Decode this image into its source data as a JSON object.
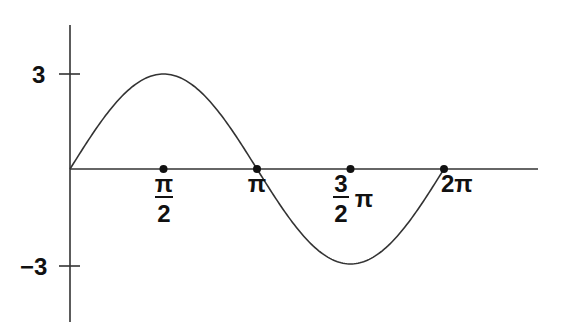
{
  "chart_data": {
    "type": "line",
    "title": "",
    "xlabel": "",
    "ylabel": "",
    "function": "y = 3 sin(x)",
    "amplitude": 3,
    "period": "2π",
    "x_ticks": [
      {
        "value": 1.5708,
        "label": "π/2",
        "num": "π",
        "den": "2"
      },
      {
        "value": 3.1416,
        "label": "π"
      },
      {
        "value": 4.7124,
        "label": "3/2 π",
        "num": "3",
        "den": "2",
        "suffix": "π"
      },
      {
        "value": 6.2832,
        "label": "2π"
      }
    ],
    "y_ticks": [
      {
        "value": 3,
        "label": "3"
      },
      {
        "value": -3,
        "label": "−3"
      }
    ],
    "series": [
      {
        "name": "3 sin x",
        "x": [
          0,
          0.7854,
          1.5708,
          2.3562,
          3.1416,
          3.927,
          4.7124,
          5.4978,
          6.2832
        ],
        "values": [
          0,
          2.12,
          3,
          2.12,
          0,
          -2.12,
          -3,
          -2.12,
          0
        ]
      }
    ],
    "xlim": [
      0,
      8.1
    ],
    "ylim": [
      -4.6,
      4.6
    ],
    "grid": false,
    "legend": false,
    "marked_points": [
      {
        "x": 1.5708,
        "y": 0
      },
      {
        "x": 3.1416,
        "y": 0
      },
      {
        "x": 4.7124,
        "y": 0
      },
      {
        "x": 6.2832,
        "y": 0
      }
    ]
  },
  "labels": {
    "y_pos": "3",
    "y_neg": "−3",
    "x_half_pi_num": "π",
    "x_half_pi_den": "2",
    "x_pi": "π",
    "x_three_half_num": "3",
    "x_three_half_den": "2",
    "x_three_half_pi": "π",
    "x_two_pi": "2π"
  },
  "layout": {
    "origin_x": 70,
    "origin_y": 169,
    "px_per_quarter": 93.5,
    "px_amplitude": 95,
    "axis_top": 25,
    "axis_bottom": 322,
    "axis_right": 538,
    "stroke": "#333333"
  }
}
